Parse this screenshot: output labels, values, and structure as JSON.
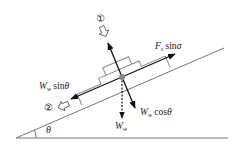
{
  "diagram": {
    "angle_label": "θ",
    "labels": {
      "fs_sin": {
        "main": "F",
        "sub": "s",
        "func": " sin",
        "var": "σ"
      },
      "ww_sin": {
        "main": "W",
        "sub": "w",
        "func": " sin",
        "var": "θ"
      },
      "ww_cos": {
        "main": "W",
        "sub": "w",
        "func": " cos",
        "var": "θ"
      },
      "ww": {
        "main": "W",
        "sub": "w"
      }
    },
    "directions": [
      {
        "marker": "①",
        "meaning": "up-normal direction"
      },
      {
        "marker": "②",
        "meaning": "down-slope direction"
      }
    ],
    "colors": {
      "line": "#888888",
      "arrow": "#111111",
      "dot": "#888888"
    }
  }
}
